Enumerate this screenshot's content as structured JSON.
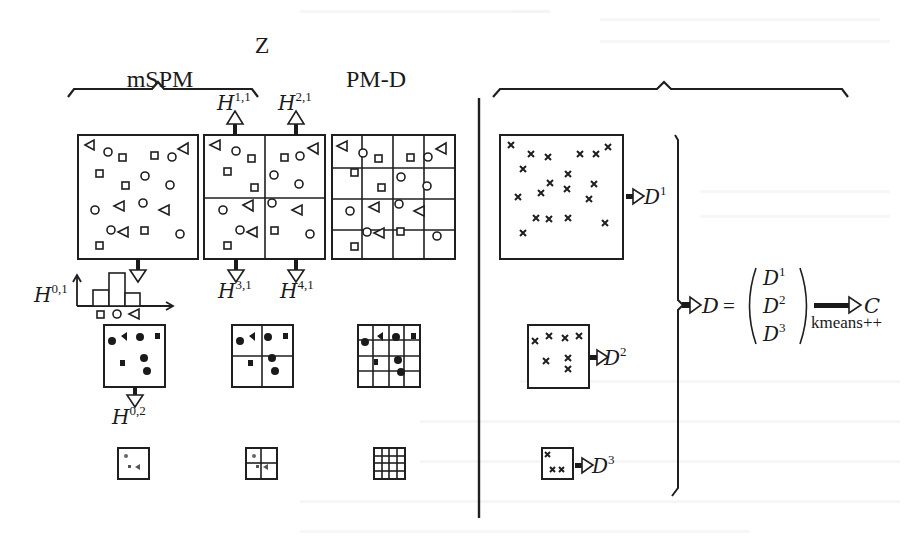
{
  "figure": {
    "title": "Z",
    "left_section": {
      "label": "mSPM"
    },
    "right_section": {
      "label": "PM-D"
    }
  },
  "mspm": {
    "levels": [
      {
        "grid": 1,
        "name": "level-0"
      },
      {
        "grid": 2,
        "name": "level-1"
      },
      {
        "grid": 4,
        "name": "level-2"
      }
    ],
    "histogram_labels": {
      "h01": {
        "base": "H",
        "sup": "0,1"
      },
      "h11": {
        "base": "H",
        "sup": "1,1"
      },
      "h21": {
        "base": "H",
        "sup": "2,1"
      },
      "h31": {
        "base": "H",
        "sup": "3,1"
      },
      "h41": {
        "base": "H",
        "sup": "4,1"
      },
      "h02": {
        "base": "H",
        "sup": "0,2"
      }
    },
    "histogram_bars": [
      {
        "symbol": "square",
        "height": 2
      },
      {
        "symbol": "circle",
        "height": 4
      },
      {
        "symbol": "triangle",
        "height": 2
      }
    ],
    "feature_symbols": [
      "square-icon",
      "circle-icon",
      "triangle-icon"
    ]
  },
  "pmd": {
    "descriptors": [
      {
        "base": "D",
        "sup": "1",
        "points": 20
      },
      {
        "base": "D",
        "sup": "2",
        "points": 7
      },
      {
        "base": "D",
        "sup": "3",
        "points": 3
      }
    ],
    "equation": {
      "lhs": "D",
      "equals": "=",
      "vector": [
        "D",
        "D",
        "D"
      ],
      "vector_sups": [
        "1",
        "2",
        "3"
      ],
      "method": "kmeans++",
      "result": "C"
    }
  },
  "colors": {
    "ink": "#1f1f1f",
    "background": "#ffffff",
    "bleed_through": "#e4e4e4"
  }
}
